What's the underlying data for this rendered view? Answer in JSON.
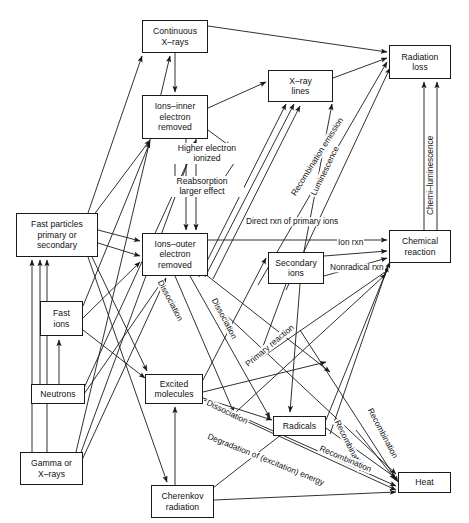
{
  "diagram": {
    "stroke_color": "#1a1a1a",
    "background_color": "#ffffff",
    "width": 469,
    "height": 523,
    "nodes": [
      {
        "id": "continuous_xrays",
        "label": "Continuous\nX–rays",
        "x": 142,
        "y": 20,
        "w": 66,
        "h": 33
      },
      {
        "id": "ions_inner",
        "label": "Ions–inner\nelectron\nremoved",
        "x": 142,
        "y": 95,
        "w": 66,
        "h": 44
      },
      {
        "id": "xray_lines",
        "label": "X–ray\nlines",
        "x": 268,
        "y": 70,
        "w": 65,
        "h": 32
      },
      {
        "id": "radiation_loss",
        "label": "Radiation\nloss",
        "x": 389,
        "y": 45,
        "w": 62,
        "h": 34
      },
      {
        "id": "fast_particles",
        "label": "Fast particles\nprimary or\nsecondary",
        "x": 16,
        "y": 213,
        "w": 82,
        "h": 44
      },
      {
        "id": "ions_outer",
        "label": "Ions–outer\nelectron\nremoved",
        "x": 142,
        "y": 233,
        "w": 66,
        "h": 43
      },
      {
        "id": "secondary_ions",
        "label": "Secondary\nions",
        "x": 268,
        "y": 252,
        "w": 56,
        "h": 32
      },
      {
        "id": "chemical_reaction",
        "label": "Chemical\nreaction",
        "x": 389,
        "y": 230,
        "w": 62,
        "h": 33
      },
      {
        "id": "fast_ions",
        "label": "Fast\nions",
        "x": 40,
        "y": 301,
        "w": 43,
        "h": 35
      },
      {
        "id": "neutrons",
        "label": "Neutrons",
        "x": 31,
        "y": 384,
        "w": 54,
        "h": 20
      },
      {
        "id": "excited_molecules",
        "label": "Excited\nmolecules",
        "x": 145,
        "y": 374,
        "w": 58,
        "h": 30
      },
      {
        "id": "radicals",
        "label": "Radicals",
        "x": 273,
        "y": 416,
        "w": 53,
        "h": 20
      },
      {
        "id": "gamma_xrays",
        "label": "Gamma or\nX–rays",
        "x": 20,
        "y": 452,
        "w": 63,
        "h": 33
      },
      {
        "id": "heat",
        "label": "Heat",
        "x": 398,
        "y": 472,
        "w": 53,
        "h": 21
      },
      {
        "id": "cherenkov",
        "label": "Cherenkov\nradiation",
        "x": 151,
        "y": 485,
        "w": 63,
        "h": 33
      }
    ],
    "free_labels": [
      {
        "id": "higher_electron_ionized",
        "label": "Higher electron\nionized",
        "x": 163,
        "y": 143,
        "w": 86
      },
      {
        "id": "reabsorption_larger",
        "label": "Reabsorption\nlarger effect",
        "x": 160,
        "y": 176,
        "w": 82
      }
    ],
    "edge_labels": [
      {
        "id": "direct_rxn",
        "label": "Direct rxn of primary ions",
        "x": 245,
        "y": 228,
        "angle": 0
      },
      {
        "id": "ion_rxn",
        "label": "Ion rxn",
        "x": 337,
        "y": 243,
        "angle": 0
      },
      {
        "id": "nonradical_rxn",
        "label": "Nonradical rxn",
        "x": 329,
        "y": 268,
        "angle": 0
      },
      {
        "id": "recombination_emission",
        "label": "Recombination emission",
        "x": 297,
        "y": 190,
        "angle": -58
      },
      {
        "id": "luminescence",
        "label": "Luminescence",
        "x": 312,
        "y": 180,
        "angle": -64
      },
      {
        "id": "chemi_luminescence",
        "label": "Chemi–luminescence",
        "x": 428,
        "y": 210,
        "angle": -90
      },
      {
        "id": "dissociation_1",
        "label": "Dissociation",
        "x": 155,
        "y": 282,
        "angle": 62
      },
      {
        "id": "dissociation_2",
        "label": "Dissociation",
        "x": 210,
        "y": 300,
        "angle": 62
      },
      {
        "id": "dissociation_3",
        "label": "Dissociation",
        "x": 206,
        "y": 402,
        "angle": 26
      },
      {
        "id": "primary_reaction",
        "label": "Primary reaction",
        "x": 254,
        "y": 357,
        "angle": -40
      },
      {
        "id": "degradation_energy",
        "label": "Degradation of (excitation) energy",
        "x": 207,
        "y": 436,
        "angle": 22
      },
      {
        "id": "recombination_1",
        "label": "Recombination",
        "x": 334,
        "y": 420,
        "angle": 63
      },
      {
        "id": "recombination_2",
        "label": "Recombination",
        "x": 367,
        "y": 408,
        "angle": 62
      },
      {
        "id": "recombination_3",
        "label": "Recombination",
        "x": 319,
        "y": 448,
        "angle": 23
      }
    ]
  }
}
